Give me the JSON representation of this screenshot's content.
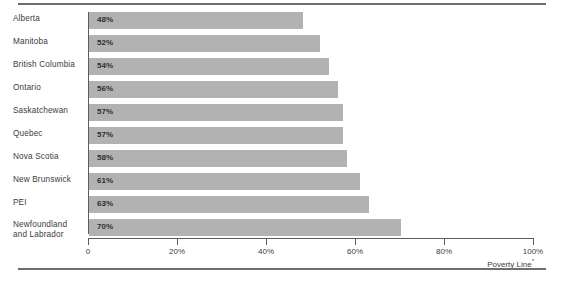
{
  "chart_data": {
    "type": "bar",
    "orientation": "horizontal",
    "title": "",
    "xlabel": "",
    "ylabel": "",
    "xlim": [
      0,
      100
    ],
    "grid": false,
    "legend": null,
    "categories": [
      "Alberta",
      "Manitoba",
      "British Columbia",
      "Ontario",
      "Saskatchewan",
      "Quebec",
      "Nova Scotia",
      "New Brunswick",
      "PEI",
      "Newfoundland\nand Labrador"
    ],
    "values": [
      48,
      52,
      54,
      56,
      57,
      57,
      58,
      61,
      63,
      70
    ],
    "value_labels": [
      "48%",
      "52%",
      "54%",
      "56%",
      "57%",
      "57%",
      "58%",
      "61%",
      "63%",
      "70%"
    ],
    "xticks": [
      0,
      20,
      40,
      60,
      80,
      100
    ],
    "xtick_labels": [
      "0",
      "20%",
      "40%",
      "60%",
      "80%",
      "100%"
    ],
    "annotation": "Poverty Line",
    "annotation_marker": "*",
    "bar_color": "#b2b2b2",
    "axis_color": "#5d5d5d",
    "rule_color": "#6e6e6e",
    "text_color": "#3d3d3d"
  }
}
